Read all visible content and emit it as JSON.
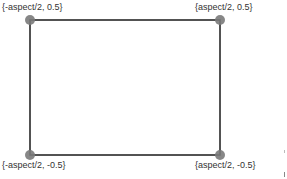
{
  "diagram": {
    "type": "rectangle-corners",
    "line_color": "#1a1a1a",
    "dot_color": "#7a7a7a",
    "corners": [
      {
        "id": "top-left",
        "label": "{-aspect/2, 0.5}",
        "x": 30,
        "y": 20
      },
      {
        "id": "top-right",
        "label": "{aspect/2, 0.5}",
        "x": 220,
        "y": 20
      },
      {
        "id": "bottom-left",
        "label": "{-aspect/2, -0.5}",
        "x": 30,
        "y": 155
      },
      {
        "id": "bottom-right",
        "label": "{aspect/2, -0.5}",
        "x": 220,
        "y": 155
      }
    ]
  }
}
